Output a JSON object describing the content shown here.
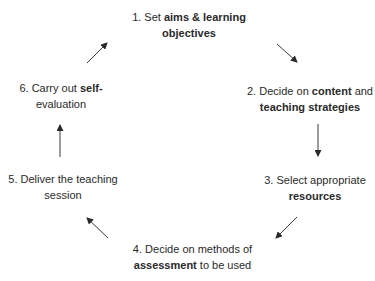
{
  "diagram": {
    "type": "cycle",
    "steps": [
      {
        "number": "1.",
        "pre": " Set ",
        "bold": "aims & learning",
        "line2_bold": "objectives",
        "line2_post": ""
      },
      {
        "number": "2.",
        "pre": " Decide on ",
        "bold": "content",
        "post": " and",
        "line2_bold": "teaching strategies"
      },
      {
        "number": "3.",
        "pre": " Select appropriate",
        "line2_bold": "resources"
      },
      {
        "number": "4.",
        "pre": " Decide on methods of",
        "line2_bold": "assessment",
        "line2_post": " to be used"
      },
      {
        "number": "5.",
        "pre": " Deliver the teaching",
        "line2_plain": "session"
      },
      {
        "number": "6.",
        "pre": " Carry out ",
        "bold": "self-",
        "line2_plain": "evaluation"
      }
    ],
    "arrows": [
      {
        "from": "1",
        "to": "2",
        "direction": "down-right"
      },
      {
        "from": "2",
        "to": "3",
        "direction": "down"
      },
      {
        "from": "3",
        "to": "4",
        "direction": "down-left"
      },
      {
        "from": "4",
        "to": "5",
        "direction": "up-left"
      },
      {
        "from": "5",
        "to": "6",
        "direction": "up"
      },
      {
        "from": "6",
        "to": "1",
        "direction": "up-right"
      }
    ],
    "colors": {
      "text": "#2a2a2a",
      "arrow": "#333333",
      "background": "#ffffff"
    }
  }
}
